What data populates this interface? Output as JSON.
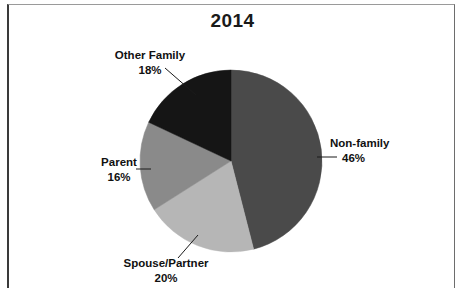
{
  "chart_data": {
    "type": "pie",
    "title": "2014",
    "categories": [
      "Non-family",
      "Spouse/Partner",
      "Parent",
      "Other Family"
    ],
    "values": [
      46,
      20,
      16,
      18
    ],
    "value_labels": [
      "46%",
      "20%",
      "16%",
      "18%"
    ],
    "unit": "%",
    "start_angle_deg": 0,
    "direction": "clockwise",
    "legend": "none",
    "labels_position": "outside-with-leader-lines",
    "colors": [
      "#4a4a4a",
      "#b6b6b6",
      "#8a8a8a",
      "#151515"
    ],
    "slices": [
      {
        "name": "Non-family",
        "value": 46,
        "label": "Non-family",
        "pct_label": "46%",
        "color": "#4a4a4a"
      },
      {
        "name": "Spouse/Partner",
        "value": 20,
        "label": "Spouse/Partner",
        "pct_label": "20%",
        "color": "#b6b6b6"
      },
      {
        "name": "Parent",
        "value": 16,
        "label": "Parent",
        "pct_label": "16%",
        "color": "#8a8a8a"
      },
      {
        "name": "Other Family",
        "value": 18,
        "label": "Other Family",
        "pct_label": "18%",
        "color": "#151515"
      }
    ]
  },
  "chart": {
    "title": "2014",
    "geometry": {
      "cx": 231,
      "cy": 161,
      "r": 91
    },
    "border_color": "#3a3a3a",
    "background": "#ffffff"
  }
}
